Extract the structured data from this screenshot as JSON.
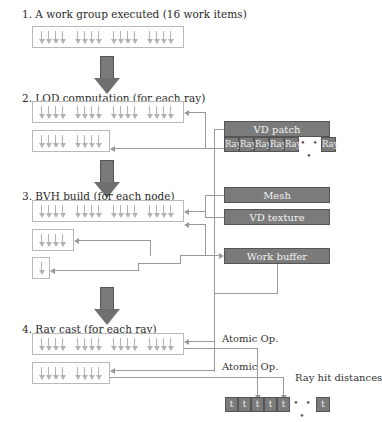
{
  "steps": [
    {
      "label": "1. A work group executed (16 work items)"
    },
    {
      "label": "2. LOD computation (for each ray)"
    },
    {
      "label": "3. BVH build (for each node)"
    },
    {
      "label": "4. Ray cast (for each ray)"
    }
  ],
  "resources": {
    "vd_patch": {
      "title": "VD patch",
      "cells": [
        "Ray",
        "Ray",
        "Ray",
        "Ray",
        "Ray"
      ],
      "ellipsis": "• • •",
      "last_cell": "Ray"
    },
    "mesh": "Mesh",
    "vd_texture": "VD texture",
    "work_buffer": "Work buffer"
  },
  "annotations": {
    "atomic_op_1": "Atomic Op.",
    "atomic_op_2": "Atomic Op.",
    "ray_hit_distances": "Ray hit distances"
  },
  "output": {
    "cells": [
      "t",
      "t",
      "t",
      "t",
      "t"
    ],
    "ellipsis": "• • •",
    "last_cell": "t"
  },
  "work_item_groups": {
    "step1": [
      [
        16
      ]
    ],
    "step2": [
      16,
      8
    ],
    "step3": [
      16,
      4,
      1
    ],
    "step4": [
      16,
      8
    ]
  },
  "colors": {
    "resource_fill": "#7b7b7b",
    "line": "#9a9a9a",
    "box_border": "#b9b9b9"
  }
}
